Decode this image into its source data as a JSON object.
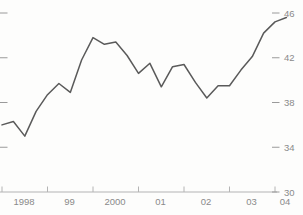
{
  "figure": {
    "description_label": ""
  },
  "chart_data": {
    "type": "line",
    "x_start": 1998.0,
    "x_step": 0.25,
    "values": [
      36.0,
      36.3,
      35.0,
      37.2,
      38.7,
      39.7,
      38.9,
      41.8,
      43.8,
      43.2,
      43.4,
      42.2,
      40.6,
      41.5,
      39.4,
      41.2,
      41.4,
      39.8,
      38.4,
      39.5,
      39.5,
      40.9,
      42.1,
      44.2,
      45.2,
      45.6
    ],
    "x_tick_years": [
      1998,
      1999,
      2000,
      2001,
      2002,
      2003,
      2004
    ],
    "x_tick_labels": [
      "1998",
      "99",
      "2000",
      "01",
      "02",
      "03",
      "04"
    ],
    "y_ticks": [
      30,
      34,
      38,
      42,
      46
    ],
    "y_tick_labels": [
      "30",
      "34",
      "38",
      "42",
      "46"
    ],
    "ylim": [
      30,
      46
    ],
    "xlim": [
      1998,
      2004.6
    ],
    "title": "",
    "xlabel": "",
    "ylabel": "",
    "legend": [],
    "grid": false,
    "line_color": "#5a5a5a",
    "axis_color": "#b4b4b4",
    "tick_dash_color": "#9a9a9a",
    "text_color": "#8a8a8a",
    "background_color": "#fdfdfc"
  }
}
